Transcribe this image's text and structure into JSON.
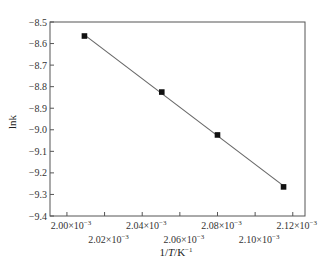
{
  "chart_data": {
    "type": "scatter",
    "title": "",
    "xlabel": "1/T/K⁻¹",
    "ylabel": "lnk",
    "xlim": [
      0.001991,
      0.0021265
    ],
    "ylim": [
      -9.4,
      -8.5
    ],
    "grid": false,
    "legend": null,
    "x_ticks": [
      0.002,
      0.00202,
      0.00204,
      0.00206,
      0.00208,
      0.0021,
      0.00212
    ],
    "x_tick_labels": [
      "2.00×10",
      "2.02×10",
      "2.04×10",
      "2.06×10",
      "2.08×10",
      "2.10×10",
      "2.12×10"
    ],
    "x_tick_exponent": "-3",
    "y_ticks": [
      -8.5,
      -8.6,
      -8.7,
      -8.8,
      -8.9,
      -9.0,
      -9.1,
      -9.2,
      -9.3,
      -9.4
    ],
    "y_tick_labels": [
      "-8.5",
      "-8.6",
      "-8.7",
      "-8.8",
      "-8.9",
      "-9.0",
      "-9.1",
      "-9.2",
      "-9.3",
      "-9.4"
    ],
    "series": [
      {
        "name": "lnk",
        "marker": "square",
        "fit_line": true,
        "x": [
          0.0020093,
          0.0020504,
          0.00208,
          0.0021151
        ],
        "y": [
          -8.565,
          -8.825,
          -9.024,
          -9.265
        ]
      }
    ]
  }
}
